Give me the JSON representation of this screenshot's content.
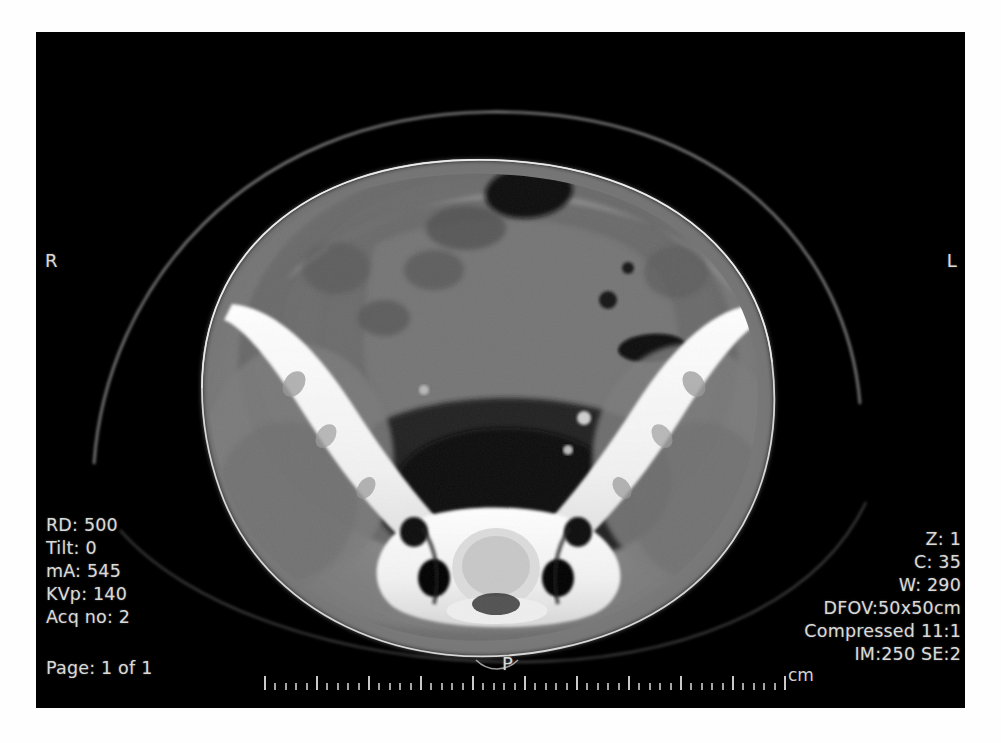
{
  "viewer": {
    "modality": "CT",
    "view": "axial-pelvis",
    "background_color": "#000000",
    "text_color": "#d9d9d9"
  },
  "acquisition": {
    "rd_label": "RD: 500",
    "tilt_label": "Tilt: 0",
    "ma_label": "mA: 545",
    "kvp_label": "KVp: 140",
    "acq_no_label": "Acq no: 2",
    "page_label": "Page: 1 of 1"
  },
  "display": {
    "zoom_label": "Z: 1",
    "center_label": "C: 35",
    "window_label": "W: 290",
    "dfov_label": "DFOV:50x50cm",
    "compression_label": "Compressed 11:1",
    "image_series_label": "IM:250 SE:2"
  },
  "orientation": {
    "right_label": "R",
    "left_label": "L",
    "posterior_label": "P"
  },
  "scale": {
    "unit_label": "cm",
    "major_ticks": 11,
    "minor_per_major": 4,
    "total_length_cm": 10
  },
  "icons": {
    "ruler": "ruler-icon",
    "orientation_marker": "orientation-marker-icon"
  }
}
